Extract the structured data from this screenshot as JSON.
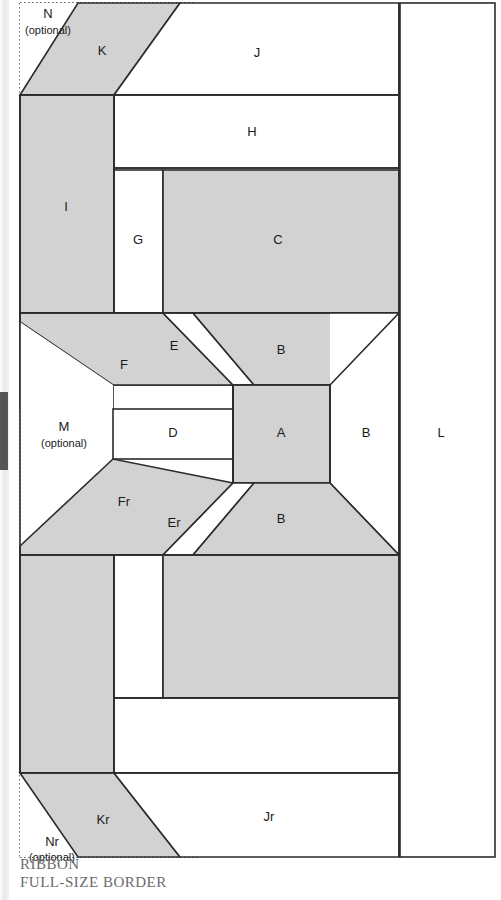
{
  "caption": {
    "line1": "RIBBON",
    "line2": "FULL-SIZE BORDER"
  },
  "colors": {
    "fabric_shaded": "#d2d2d2",
    "fabric_plain": "#ffffff",
    "outline": "#2b2b2b",
    "label_text": "#1a1a1a",
    "caption_text": "#6b6b6b",
    "cut_guide": "#333333"
  },
  "legend": {
    "optional_note": "(optional)"
  },
  "pieces": [
    {
      "id": "N",
      "label": "N",
      "note": "(optional)",
      "shaded": false,
      "x": 48,
      "y": 20
    },
    {
      "id": "K",
      "label": "K",
      "note": "",
      "shaded": true,
      "x": 102,
      "y": 52
    },
    {
      "id": "J",
      "label": "J",
      "note": "",
      "shaded": false,
      "x": 257,
      "y": 54
    },
    {
      "id": "I",
      "label": "I",
      "note": "",
      "shaded": true,
      "x": 66,
      "y": 208
    },
    {
      "id": "H",
      "label": "H",
      "note": "",
      "shaded": false,
      "x": 252,
      "y": 133
    },
    {
      "id": "G",
      "label": "G",
      "note": "",
      "shaded": false,
      "x": 138,
      "y": 241
    },
    {
      "id": "C",
      "label": "C",
      "note": "",
      "shaded": true,
      "x": 278,
      "y": 241
    },
    {
      "id": "F",
      "label": "F",
      "note": "",
      "shaded": true,
      "x": 124,
      "y": 366
    },
    {
      "id": "E",
      "label": "E",
      "note": "",
      "shaded": false,
      "x": 174,
      "y": 347
    },
    {
      "id": "Bt",
      "label": "B",
      "note": "",
      "shaded": true,
      "x": 281,
      "y": 351
    },
    {
      "id": "M",
      "label": "M",
      "note": "(optional)",
      "shaded": false,
      "x": 64,
      "y": 428
    },
    {
      "id": "D",
      "label": "D",
      "note": "",
      "shaded": false,
      "x": 173,
      "y": 434
    },
    {
      "id": "A",
      "label": "A",
      "note": "",
      "shaded": true,
      "x": 281,
      "y": 434
    },
    {
      "id": "Br",
      "label": "B",
      "note": "",
      "shaded": false,
      "x": 366,
      "y": 434
    },
    {
      "id": "L",
      "label": "L",
      "note": "",
      "shaded": false,
      "x": 441,
      "y": 434
    },
    {
      "id": "Fr",
      "label": "Fr",
      "note": "",
      "shaded": true,
      "x": 124,
      "y": 503
    },
    {
      "id": "Er",
      "label": "Er",
      "note": "",
      "shaded": false,
      "x": 174,
      "y": 524
    },
    {
      "id": "Bb",
      "label": "B",
      "note": "",
      "shaded": true,
      "x": 281,
      "y": 520
    },
    {
      "id": "Kr",
      "label": "Kr",
      "note": "",
      "shaded": true,
      "x": 103,
      "y": 821
    },
    {
      "id": "Jr",
      "label": "Jr",
      "note": "",
      "shaded": false,
      "x": 269,
      "y": 818
    },
    {
      "id": "Nr",
      "label": "Nr",
      "note": "(optional)",
      "shaded": false,
      "x": 52,
      "y": 843
    }
  ]
}
